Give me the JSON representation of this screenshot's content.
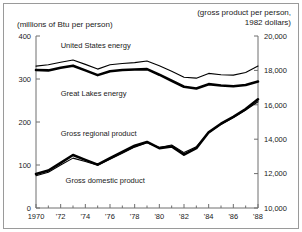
{
  "figure": {
    "left_unit_label": "(millions of Btu per person)",
    "right_unit_label": "(gross product per person,\n1982 dollars)"
  },
  "chart_data": {
    "type": "line",
    "title": "",
    "subtitle": "",
    "xlabel": "",
    "ylabel": "(millions of Btu per person)",
    "y2label": "(gross product per person, 1982 dollars)",
    "grid": false,
    "legend": "inline-annotations",
    "x": [
      1970,
      1971,
      1972,
      1973,
      1974,
      1975,
      1976,
      1977,
      1978,
      1979,
      1980,
      1981,
      1982,
      1983,
      1984,
      1985,
      1986,
      1987,
      1988
    ],
    "xlim": [
      1970,
      1988
    ],
    "xtick_labels": [
      "1970",
      "'72",
      "'74",
      "'76",
      "'78",
      "'80",
      "'82",
      "'84",
      "'86",
      "'88"
    ],
    "xtick_values": [
      1970,
      1972,
      1974,
      1976,
      1978,
      1980,
      1982,
      1984,
      1986,
      1988
    ],
    "ylim": [
      0,
      400
    ],
    "ytick_labels": [
      "0",
      "100",
      "200",
      "300",
      "400"
    ],
    "ytick_values": [
      0,
      100,
      200,
      300,
      400
    ],
    "y2lim": [
      10000,
      20000
    ],
    "y2tick_labels": [
      "10,000",
      "12,000",
      "14,000",
      "16,000",
      "18,000",
      "20,000"
    ],
    "y2tick_values": [
      10000,
      12000,
      14000,
      16000,
      18000,
      20000
    ],
    "series": [
      {
        "name": "United States energy",
        "axis": "left",
        "style": "thin",
        "label_text": "United States energy",
        "values": [
          330,
          333,
          339,
          344,
          334,
          323,
          333,
          336,
          338,
          342,
          331,
          318,
          304,
          302,
          313,
          310,
          309,
          315,
          330
        ]
      },
      {
        "name": "Great Lakes energy",
        "axis": "left",
        "style": "thick",
        "label_text": "Great Lakes energy",
        "values": [
          321,
          320,
          326,
          331,
          320,
          309,
          318,
          321,
          322,
          323,
          310,
          296,
          282,
          278,
          288,
          285,
          283,
          286,
          294
        ]
      },
      {
        "name": "Gross regional product",
        "axis": "right",
        "style": "thick",
        "label_text": "Gross regional product",
        "values": [
          11980,
          12180,
          12620,
          13080,
          12800,
          12520,
          12900,
          13260,
          13620,
          13840,
          13480,
          13580,
          13100,
          13480,
          14400,
          14900,
          15300,
          15750,
          16320
        ]
      },
      {
        "name": "Gross domestic product",
        "axis": "right",
        "style": "thin",
        "label_text": "Gross domestic product",
        "values": [
          11880,
          12080,
          12500,
          12900,
          12700,
          12480,
          12840,
          13180,
          13540,
          13800,
          13520,
          13660,
          13220,
          13560,
          14380,
          14860,
          15260,
          15700,
          16180
        ]
      }
    ],
    "annotations": [
      {
        "text": "United States energy",
        "x": 1972.0,
        "y_px": 48
      },
      {
        "text": "Great Lakes energy",
        "x": 1972.0,
        "y_px": 96
      },
      {
        "text": "Gross regional product",
        "x": 1972.0,
        "y_px": 136
      },
      {
        "text": "Gross domestic product",
        "x": 1972.4,
        "y_px": 183
      }
    ]
  },
  "colors": {
    "line": "#000000",
    "axis": "#6e6e6e",
    "text": "#1a1a1a",
    "frame": "#9a9a9a",
    "background": "#ffffff"
  }
}
